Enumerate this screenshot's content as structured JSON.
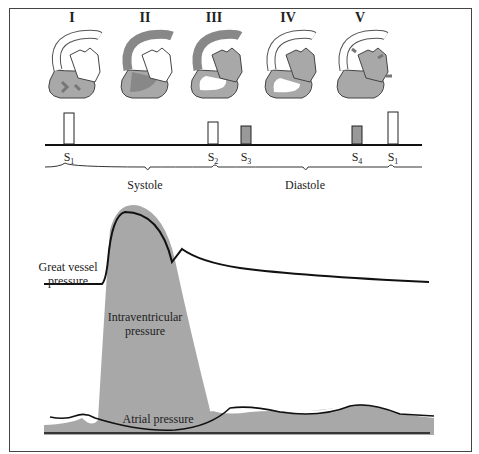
{
  "phases": [
    {
      "numeral": "I",
      "x": 72
    },
    {
      "numeral": "II",
      "x": 145
    },
    {
      "numeral": "III",
      "x": 214
    },
    {
      "numeral": "IV",
      "x": 288
    },
    {
      "numeral": "V",
      "x": 360
    }
  ],
  "heart_sounds": [
    {
      "label": "S",
      "sub": "1",
      "x": 67,
      "height": 30,
      "filled": false
    },
    {
      "label": "S",
      "sub": "2",
      "x": 212,
      "height": 21,
      "filled": false
    },
    {
      "label": "S",
      "sub": "3",
      "x": 245,
      "height": 18,
      "filled": true
    },
    {
      "label": "S",
      "sub": "4",
      "x": 356,
      "height": 18,
      "filled": true
    },
    {
      "label": "S",
      "sub": "1",
      "x": 392,
      "height": 32,
      "filled": false
    }
  ],
  "cycle_phases": {
    "systole": "Systole",
    "diastole": "Diastole"
  },
  "curve_labels": {
    "great_vessel_line1": "Great vessel",
    "great_vessel_line2": "pressure",
    "intraventricular_line1": "Intraventricular",
    "intraventricular_line2": "pressure",
    "atrial": "Atrial pressure"
  },
  "colors": {
    "fill_gray": "#a8a8a8",
    "line": "#111111",
    "outline": "#444444"
  }
}
